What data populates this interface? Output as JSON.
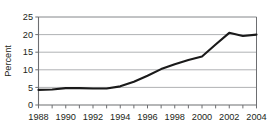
{
  "chart_data": {
    "type": "line",
    "title": "",
    "subtitle": "",
    "xlabel": "",
    "ylabel": "Percent",
    "xlim": [
      1988,
      2004
    ],
    "ylim": [
      0,
      25
    ],
    "ytick_interval": 5,
    "xtick_interval": 1,
    "xtick_label_interval": 2,
    "grid": "horizontal",
    "legend": "none",
    "line_color": "#1a1a1a",
    "grid_color": "#a7a9ac",
    "axis_color": "#6d6e71",
    "x": [
      1988,
      1989,
      1990,
      1991,
      1992,
      1993,
      1994,
      1995,
      1996,
      1997,
      1998,
      1999,
      2000,
      2001,
      2002,
      2003,
      2004
    ],
    "values": [
      4.3,
      4.4,
      4.8,
      4.8,
      4.7,
      4.7,
      5.3,
      6.6,
      8.3,
      10.2,
      11.6,
      12.8,
      13.8,
      17.2,
      20.5,
      19.6,
      20.0
    ],
    "y_tick_labels": [
      "0",
      "5",
      "10",
      "15",
      "20",
      "25"
    ],
    "y_tick_values": [
      0,
      5,
      10,
      15,
      20,
      25
    ],
    "x_tick_labels": [
      "1988",
      "1990",
      "1992",
      "1994",
      "1996",
      "1998",
      "2000",
      "2002",
      "2004"
    ],
    "x_tick_label_values": [
      1988,
      1990,
      1992,
      1994,
      1996,
      1998,
      2000,
      2002,
      2004
    ],
    "annotations": []
  }
}
